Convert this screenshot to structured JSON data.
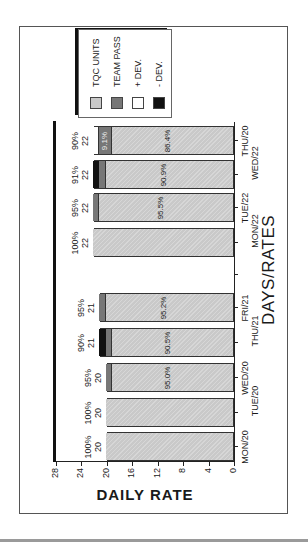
{
  "chart_data": {
    "type": "bar",
    "stacked": true,
    "orientation": "rotated -90deg (vertical bars drawn sideways)",
    "title": "DAYS/RATES",
    "xlabel": "DAYS/RATES",
    "ylabel": "DAILY RATE",
    "ylim": [
      0,
      28
    ],
    "yticks": [
      0,
      4,
      8,
      12,
      16,
      20,
      24,
      28
    ],
    "categories": [
      "MON/20",
      "TUE/20",
      "WED/20",
      "THU/21",
      "FRI/21",
      "MON/22",
      "TUE/22",
      "WED/22",
      "THU/20"
    ],
    "series": [
      {
        "name": "TQC UNITS",
        "color": "#c9c9c9",
        "values": [
          20,
          20,
          19,
          19,
          20,
          22,
          21,
          20,
          19
        ]
      },
      {
        "name": "TEAM PASS",
        "color": "#777777",
        "values": [
          0,
          0,
          1,
          1,
          1,
          0,
          1,
          1,
          2
        ]
      },
      {
        "name": "+ DEV.",
        "color": "#ffffff",
        "values": [
          0,
          0,
          0,
          0,
          0,
          0,
          0,
          0,
          1
        ]
      },
      {
        "name": "- DEV.",
        "color": "#111111",
        "values": [
          0,
          0,
          0,
          1,
          0,
          0,
          0,
          1,
          0
        ]
      }
    ],
    "bar_top_labels": [
      {
        "rate": "100%",
        "total": "20"
      },
      {
        "rate": "100%",
        "total": "20"
      },
      {
        "rate": "95%",
        "total": "20"
      },
      {
        "rate": "90%",
        "total": "21"
      },
      {
        "rate": "95%",
        "total": "21"
      },
      {
        "rate": "100%",
        "total": "22"
      },
      {
        "rate": "95%",
        "total": "22"
      },
      {
        "rate": "91%",
        "total": "22"
      },
      {
        "rate": "90%",
        "total": "22"
      }
    ],
    "inner_labels": [
      "",
      "",
      "95.0%",
      "90.5%",
      "95.2%",
      "",
      "95.5%",
      "90.9%",
      "86.4%"
    ],
    "team_pass_labels": [
      "",
      "",
      "",
      "",
      "",
      "",
      "",
      "",
      "9.1%"
    ],
    "legend_position": "upper right (in rotated view: top)",
    "grid": false
  },
  "legend": {
    "items": [
      {
        "label": "TQC UNITS",
        "color": "#c9c9c9"
      },
      {
        "label": "TEAM PASS",
        "color": "#777777"
      },
      {
        "label": "+ DEV.",
        "color": "#ffffff"
      },
      {
        "label": "- DEV.",
        "color": "#111111"
      }
    ]
  },
  "axis": {
    "ylabels": [
      "0",
      "4",
      "8",
      "12",
      "16",
      "20",
      "24",
      "28"
    ]
  }
}
